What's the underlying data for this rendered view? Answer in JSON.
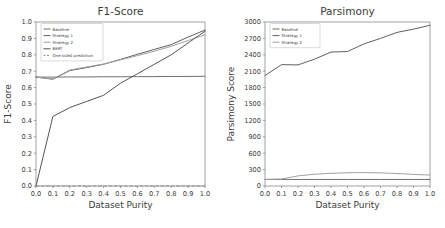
{
  "figure": {
    "background": "#ffffff",
    "panels": [
      "f1",
      "parsimony"
    ]
  },
  "chart_data": [
    {
      "id": "f1",
      "type": "line",
      "title": "F1-Score",
      "xlabel": "Dataset Purity",
      "ylabel": "F1-Score",
      "xlim": [
        0.0,
        1.0
      ],
      "ylim": [
        0.0,
        1.0
      ],
      "grid": false,
      "legend_position": "upper left",
      "xticks": [
        "0.0",
        "0.1",
        "0.2",
        "0.3",
        "0.4",
        "0.5",
        "0.6",
        "0.7",
        "0.8",
        "0.9",
        "1.0"
      ],
      "xtick_values": [
        0.0,
        0.1,
        0.2,
        0.3,
        0.4,
        0.5,
        0.6,
        0.7,
        0.8,
        0.9,
        1.0
      ],
      "yticks": [
        "0.0",
        "0.1",
        "0.2",
        "0.3",
        "0.4",
        "0.5",
        "0.6",
        "0.7",
        "0.8",
        "0.9",
        "1.0"
      ],
      "ytick_values": [
        0.0,
        0.1,
        0.2,
        0.3,
        0.4,
        0.5,
        0.6,
        0.7,
        0.8,
        0.9,
        1.0
      ],
      "x": [
        0.0,
        0.1,
        0.2,
        0.3,
        0.4,
        0.5,
        0.6,
        0.7,
        0.8,
        0.9,
        1.0
      ],
      "series": [
        {
          "name": "Baseline",
          "color": "#6f6f6f",
          "dash": "none",
          "values": [
            0.664,
            0.664,
            0.665,
            0.665,
            0.666,
            0.666,
            0.667,
            0.667,
            0.668,
            0.668,
            0.669
          ]
        },
        {
          "name": "Strategy 1",
          "color": "#5f5f5f",
          "dash": "none",
          "values": [
            0.664,
            0.651,
            0.704,
            0.722,
            0.742,
            0.772,
            0.803,
            0.833,
            0.862,
            0.908,
            0.951
          ]
        },
        {
          "name": "Strategy 2",
          "color": "#a0a0a0",
          "dash": "none",
          "values": [
            0.664,
            0.653,
            0.707,
            0.726,
            0.744,
            0.769,
            0.795,
            0.822,
            0.852,
            0.887,
            0.922
          ]
        },
        {
          "name": "BERT",
          "color": "#555555",
          "dash": "none",
          "values": [
            0.0,
            0.424,
            0.478,
            0.516,
            0.553,
            0.627,
            0.684,
            0.742,
            0.8,
            0.872,
            0.944
          ]
        },
        {
          "name": "One-sided prediction",
          "color": "#8c8c8c",
          "dash": "dashed",
          "values": [
            0.0,
            0.0,
            0.0,
            0.0,
            0.0,
            0.0,
            0.0,
            0.0,
            0.0,
            0.0,
            0.0
          ]
        }
      ]
    },
    {
      "id": "parsimony",
      "type": "line",
      "title": "Parsimony",
      "xlabel": "Dataset Purity",
      "ylabel": "Parsimony Score",
      "xlim": [
        0.0,
        1.0
      ],
      "ylim": [
        0,
        3000
      ],
      "grid": false,
      "legend_position": "upper left",
      "xticks": [
        "0.0",
        "0.1",
        "0.2",
        "0.3",
        "0.4",
        "0.5",
        "0.6",
        "0.7",
        "0.8",
        "0.9",
        "1.0"
      ],
      "xtick_values": [
        0.0,
        0.1,
        0.2,
        0.3,
        0.4,
        0.5,
        0.6,
        0.7,
        0.8,
        0.9,
        1.0
      ],
      "yticks": [
        "0",
        "300",
        "600",
        "900",
        "1200",
        "1500",
        "1800",
        "2100",
        "2400",
        "2700",
        "3000"
      ],
      "ytick_values": [
        0,
        300,
        600,
        900,
        1200,
        1500,
        1800,
        2100,
        2400,
        2700,
        3000
      ],
      "x": [
        0.0,
        0.1,
        0.2,
        0.3,
        0.4,
        0.5,
        0.6,
        0.7,
        0.8,
        0.9,
        1.0
      ],
      "series": [
        {
          "name": "Baseline",
          "color": "#6f6f6f",
          "dash": "none",
          "values": [
            120,
            120,
            120,
            120,
            120,
            120,
            120,
            120,
            120,
            120,
            120
          ]
        },
        {
          "name": "Strategy 1",
          "color": "#5f5f5f",
          "dash": "none",
          "values": [
            2020,
            2220,
            2215,
            2320,
            2450,
            2460,
            2600,
            2700,
            2810,
            2870,
            2940
          ]
        },
        {
          "name": "Strategy 2",
          "color": "#a0a0a0",
          "dash": "none",
          "values": [
            120,
            128,
            185,
            215,
            232,
            243,
            245,
            240,
            228,
            212,
            200
          ]
        }
      ]
    }
  ]
}
